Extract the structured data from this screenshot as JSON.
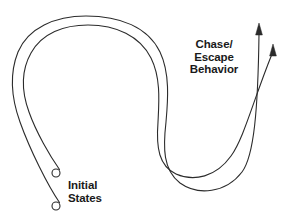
{
  "figure": {
    "type": "trajectory-diagram",
    "background_color": "#ffffff",
    "stroke_color": "#2b2b2b",
    "text_color": "#1a1a1a"
  },
  "labels": {
    "chase_escape": {
      "line1": "Chase/",
      "line2": "Escape",
      "line3": "Behavior"
    },
    "initial_states": {
      "line1": "Initial",
      "line2": "States"
    }
  },
  "markers": {
    "start_circle_upper": {
      "cx": 56,
      "cy": 173,
      "r": 4
    },
    "start_circle_lower": {
      "cx": 56,
      "cy": 206,
      "r": 4
    },
    "arrow_tip_left": {
      "x": 259,
      "y": 24
    },
    "arrow_tip_right": {
      "x": 273,
      "y": 45
    }
  },
  "trajectories": [
    {
      "name": "outer-trajectory",
      "start": "initial-state-lower",
      "end": "arrow-left"
    },
    {
      "name": "inner-trajectory",
      "start": "initial-state-upper",
      "end": "arrow-right"
    }
  ]
}
